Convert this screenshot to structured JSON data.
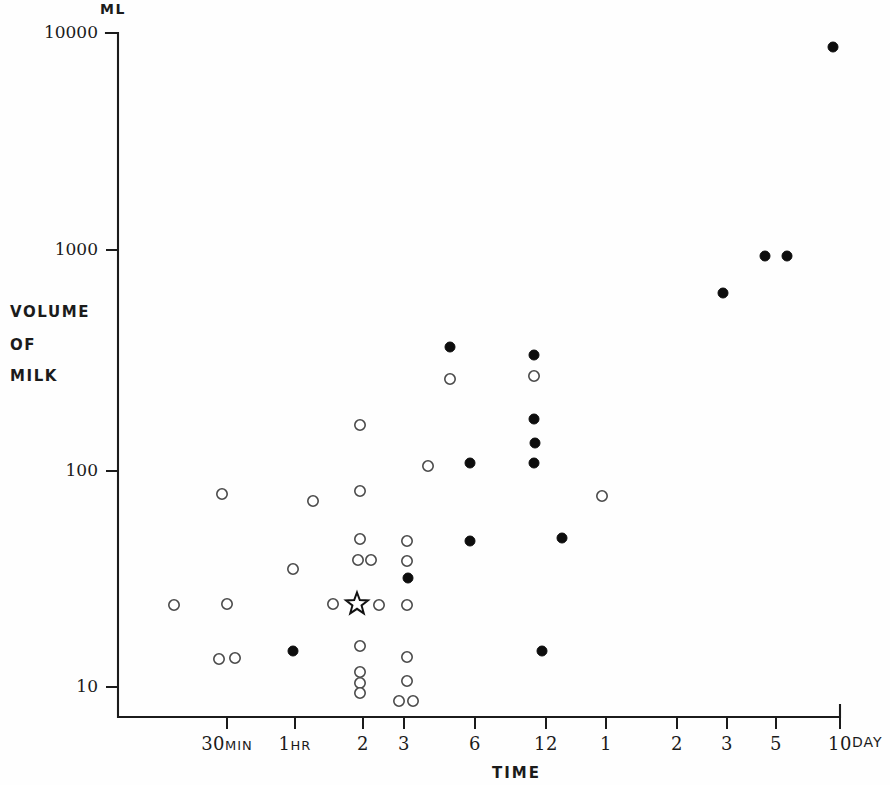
{
  "chart_data": {
    "type": "scatter",
    "title": "",
    "xlabel": "TIME",
    "ylabel": "VOLUME OF MILK",
    "y_unit_label": "ML",
    "y_axis_title_lines": [
      "VOLUME",
      "OF",
      "MILK"
    ],
    "yscale": "log",
    "ylim": [
      8,
      11000
    ],
    "ytick_labels": [
      "10000",
      "1000",
      "100",
      "10"
    ],
    "ytick_values": [
      10000,
      1000,
      100,
      10
    ],
    "grid": false,
    "legend": null,
    "xtick_labels": [
      "30MIN",
      "1HR",
      "2",
      "3",
      "6",
      "12",
      "1",
      "2",
      "3",
      "5",
      "10"
    ],
    "xtick_trailing_unit": "DAY",
    "xtick_units": [
      "MIN",
      "HR",
      "HR",
      "HR",
      "HR",
      "HR",
      "DAY",
      "DAY",
      "DAY",
      "DAY",
      "DAY"
    ],
    "xtick_pixels": [
      227,
      295,
      363,
      404,
      475,
      546,
      606,
      677,
      727,
      776,
      840
    ],
    "series": [
      {
        "name": "open-circle",
        "marker": "open circle",
        "points": [
          {
            "x_px": 222,
            "y_px": 494,
            "volume_ml": 90
          },
          {
            "x_px": 174,
            "y_px": 605,
            "volume_ml": 24
          },
          {
            "x_px": 227,
            "y_px": 604,
            "volume_ml": 24
          },
          {
            "x_px": 219,
            "y_px": 659,
            "volume_ml": 12.5
          },
          {
            "x_px": 235,
            "y_px": 658,
            "volume_ml": 12.8
          },
          {
            "x_px": 313,
            "y_px": 501,
            "volume_ml": 84
          },
          {
            "x_px": 293,
            "y_px": 569,
            "volume_ml": 37
          },
          {
            "x_px": 333,
            "y_px": 604,
            "volume_ml": 24
          },
          {
            "x_px": 360,
            "y_px": 425,
            "volume_ml": 185
          },
          {
            "x_px": 360,
            "y_px": 491,
            "volume_ml": 95
          },
          {
            "x_px": 360,
            "y_px": 539,
            "volume_ml": 52
          },
          {
            "x_px": 358,
            "y_px": 560,
            "volume_ml": 39
          },
          {
            "x_px": 371,
            "y_px": 560,
            "volume_ml": 39
          },
          {
            "x_px": 379,
            "y_px": 605,
            "volume_ml": 24
          },
          {
            "x_px": 360,
            "y_px": 646,
            "volume_ml": 15
          },
          {
            "x_px": 360,
            "y_px": 672,
            "volume_ml": 11
          },
          {
            "x_px": 360,
            "y_px": 683,
            "volume_ml": 9.8
          },
          {
            "x_px": 360,
            "y_px": 693,
            "volume_ml": 8.9
          },
          {
            "x_px": 407,
            "y_px": 541,
            "volume_ml": 51
          },
          {
            "x_px": 407,
            "y_px": 561,
            "volume_ml": 39
          },
          {
            "x_px": 407,
            "y_px": 605,
            "volume_ml": 23
          },
          {
            "x_px": 407,
            "y_px": 657,
            "volume_ml": 14
          },
          {
            "x_px": 407,
            "y_px": 681,
            "volume_ml": 10.5
          },
          {
            "x_px": 399,
            "y_px": 701,
            "volume_ml": 8.4
          },
          {
            "x_px": 413,
            "y_px": 701,
            "volume_ml": 8.4
          },
          {
            "x_px": 428,
            "y_px": 466,
            "volume_ml": 120
          },
          {
            "x_px": 450,
            "y_px": 379,
            "volume_ml": 290
          },
          {
            "x_px": 534,
            "y_px": 376,
            "volume_ml": 300
          },
          {
            "x_px": 602,
            "y_px": 496,
            "volume_ml": 86
          }
        ]
      },
      {
        "name": "filled-circle",
        "marker": "filled circle",
        "points": [
          {
            "x_px": 293,
            "y_px": 651,
            "volume_ml": 14
          },
          {
            "x_px": 408,
            "y_px": 578,
            "volume_ml": 33
          },
          {
            "x_px": 450,
            "y_px": 347,
            "volume_ml": 390
          },
          {
            "x_px": 470,
            "y_px": 463,
            "volume_ml": 122
          },
          {
            "x_px": 470,
            "y_px": 541,
            "volume_ml": 51
          },
          {
            "x_px": 534,
            "y_px": 355,
            "volume_ml": 350
          },
          {
            "x_px": 534,
            "y_px": 419,
            "volume_ml": 195
          },
          {
            "x_px": 535,
            "y_px": 443,
            "volume_ml": 148
          },
          {
            "x_px": 534,
            "y_px": 463,
            "volume_ml": 128
          },
          {
            "x_px": 542,
            "y_px": 651,
            "volume_ml": 14
          },
          {
            "x_px": 562,
            "y_px": 538,
            "volume_ml": 53
          },
          {
            "x_px": 723,
            "y_px": 293,
            "volume_ml": 620
          },
          {
            "x_px": 765,
            "y_px": 256,
            "volume_ml": 900
          },
          {
            "x_px": 787,
            "y_px": 256,
            "volume_ml": 900
          },
          {
            "x_px": 833,
            "y_px": 47,
            "volume_ml": 8600
          }
        ]
      },
      {
        "name": "star",
        "marker": "open star",
        "points": [
          {
            "x_px": 357,
            "y_px": 604,
            "volume_ml": 24
          }
        ]
      }
    ]
  },
  "axes": {
    "unit_top": "ML",
    "y_title": [
      "VOLUME",
      "OF",
      "MILK"
    ],
    "x_title": "TIME",
    "day_suffix": "DAY",
    "yticks": [
      {
        "label": "10000",
        "y_px": 33
      },
      {
        "label": "1000",
        "y_px": 250
      },
      {
        "label": "100",
        "y_px": 471
      },
      {
        "label": "10",
        "y_px": 687
      }
    ],
    "xticks": [
      {
        "label": "30",
        "unit": "MIN",
        "x_px": 227
      },
      {
        "label": "1",
        "unit": "HR",
        "x_px": 295
      },
      {
        "label": "2",
        "unit": "",
        "x_px": 363
      },
      {
        "label": "3",
        "unit": "",
        "x_px": 404
      },
      {
        "label": "6",
        "unit": "",
        "x_px": 475
      },
      {
        "label": "12",
        "unit": "",
        "x_px": 546
      },
      {
        "label": "1",
        "unit": "",
        "x_px": 606
      },
      {
        "label": "2",
        "unit": "",
        "x_px": 677
      },
      {
        "label": "3",
        "unit": "",
        "x_px": 727
      },
      {
        "label": "5",
        "unit": "",
        "x_px": 776
      },
      {
        "label": "10",
        "unit": "",
        "x_px": 840
      }
    ]
  }
}
